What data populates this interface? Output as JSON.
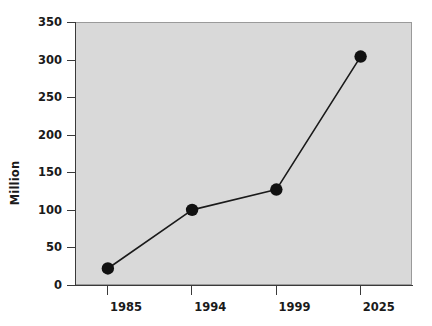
{
  "chart_data": {
    "type": "line",
    "title": "",
    "subtitle": "",
    "xlabel": "",
    "ylabel": "Million",
    "categories": [
      "1985",
      "1994",
      "1999",
      "2025"
    ],
    "values": [
      22,
      100,
      127,
      304
    ],
    "series": [
      {
        "name": "Million",
        "values": [
          22,
          100,
          127,
          304
        ]
      }
    ],
    "ylim": [
      0,
      350
    ],
    "yticks": [
      0,
      50,
      100,
      150,
      200,
      250,
      300,
      350
    ],
    "ytick_labels": [
      "0",
      "50",
      "100",
      "150",
      "200",
      "250",
      "300",
      "350"
    ],
    "xtick_labels": [
      "1985",
      "1994",
      "1999",
      "2025"
    ],
    "grid": false,
    "legend": false,
    "legend_position": "none",
    "annotations": [],
    "marker": "filled-circle",
    "colors": {
      "plot_background": "#d9d9d9",
      "figure_background": "#ffffff",
      "line": "#1a1a1a",
      "marker": "#111111",
      "axis": "#3a3a3a",
      "text": "#1a1a1a"
    }
  }
}
